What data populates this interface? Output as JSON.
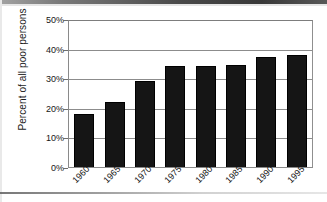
{
  "chart_data": {
    "type": "bar",
    "title": "",
    "subtitle": "",
    "xlabel": "",
    "ylabel": "Percent of all poor persons",
    "categories": [
      "1960",
      "1965",
      "1970",
      "1975",
      "1980",
      "1985",
      "1990",
      "1995"
    ],
    "values": [
      18,
      22,
      29,
      34,
      34,
      34.5,
      37,
      38
    ],
    "ylim": [
      0,
      50
    ],
    "y_ticks": [
      0,
      10,
      20,
      30,
      40,
      50
    ],
    "y_tick_labels": [
      "0%",
      "10%",
      "20%",
      "30%",
      "40%",
      "50%"
    ],
    "grid": "horizontal",
    "legend": "none",
    "bar_color": "#151515",
    "gridline_color": "#8c8c8c",
    "axis_color": "#8a8a8a",
    "x_tick_rotation": -45
  },
  "axes": {
    "y_title": "Percent of all poor persons"
  }
}
